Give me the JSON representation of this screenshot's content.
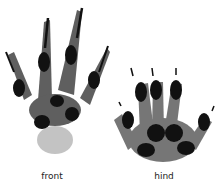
{
  "figure": {
    "front": {
      "label": "front"
    },
    "hind": {
      "label": "hind"
    }
  },
  "colors": {
    "ink": "#1a1a1a",
    "stipple": "#555555",
    "background": "#ffffff"
  }
}
